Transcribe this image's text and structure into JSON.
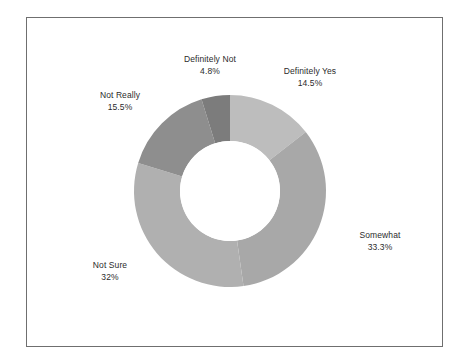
{
  "chart_data": {
    "type": "pie",
    "variant": "donut",
    "title": "",
    "subtitle": "",
    "xlabel": "",
    "ylabel": "",
    "legend": "none",
    "labels_position": "outside",
    "start_angle_deg": 0,
    "direction": "clockwise",
    "categories": [
      "Definitely Yes",
      "Somewhat",
      "Not Sure",
      "Not Really",
      "Definitely Not"
    ],
    "values": [
      14.5,
      33.3,
      32.0,
      15.5,
      4.8
    ],
    "value_unit": "percent",
    "slices": [
      {
        "label": "Definitely Yes",
        "value": 14.5,
        "value_text": "14.5%",
        "color": "#bdbdbd",
        "start_deg": 0.0,
        "end_deg": 52.2
      },
      {
        "label": "Somewhat",
        "value": 33.3,
        "value_text": "33.3%",
        "color": "#a8a8a8",
        "start_deg": 52.2,
        "end_deg": 172.1
      },
      {
        "label": "Not Sure",
        "value": 32.0,
        "value_text": "32%",
        "color": "#b0b0b0",
        "start_deg": 172.1,
        "end_deg": 287.3
      },
      {
        "label": "Not Really",
        "value": 15.5,
        "value_text": "15.5%",
        "color": "#8e8e8e",
        "start_deg": 287.3,
        "end_deg": 343.1
      },
      {
        "label": "Definitely Not",
        "value": 4.8,
        "value_text": "4.8%",
        "color": "#7c7c7c",
        "start_deg": 343.1,
        "end_deg": 360.0
      }
    ],
    "colors": {
      "definitely_yes": "#bdbdbd",
      "somewhat": "#a8a8a8",
      "not_sure": "#b0b0b0",
      "not_really": "#8e8e8e",
      "definitely_not": "#7c7c7c",
      "hole": "#ffffff",
      "frame_border": "#6f6f6f",
      "label_text": "#2b2b2b",
      "background": "#ffffff"
    },
    "geometry": {
      "center_x": 230,
      "center_y": 191,
      "outer_radius": 96,
      "inner_radius": 50
    }
  }
}
